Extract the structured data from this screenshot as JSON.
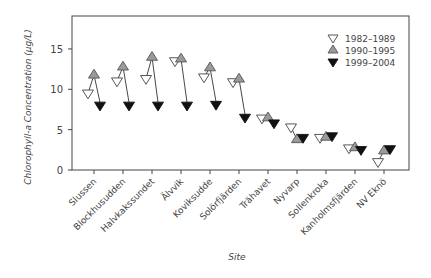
{
  "chart_data": {
    "type": "scatter",
    "title": "",
    "xlabel": "Site",
    "ylabel": "Chlorophyll-a Concentration (µg/L)",
    "ylim": [
      0,
      18
    ],
    "yticks": [
      0,
      5,
      10,
      15
    ],
    "grid": false,
    "legend_position": "upper right",
    "categories": [
      "Slussen",
      "Blockhusudden",
      "Halvkakssundet",
      "Älvvik",
      "Koviksudde",
      "Solörfjärden",
      "Trähavet",
      "Nyvarp",
      "Sollenkroka",
      "Kanholmsfjärden",
      "NV Eknö"
    ],
    "series": [
      {
        "name": "1982–1989",
        "marker": "open-down-triangle",
        "color": "#ffffff",
        "values": [
          9.5,
          11.0,
          11.3,
          13.5,
          11.5,
          10.9,
          6.4,
          5.3,
          4.0,
          2.7,
          1.0
        ]
      },
      {
        "name": "1990–1995",
        "marker": "gray-up-triangle",
        "color": "#9a9a9a",
        "values": [
          11.8,
          12.8,
          14.0,
          13.8,
          12.7,
          11.3,
          6.5,
          3.8,
          4.1,
          2.8,
          2.4
        ]
      },
      {
        "name": "1999–2004",
        "marker": "black-down-triangle",
        "color": "#111111",
        "values": [
          8.0,
          8.0,
          8.0,
          8.0,
          8.1,
          6.5,
          5.8,
          4.0,
          4.2,
          2.5,
          2.6
        ]
      }
    ],
    "annotations": "Arrows drawn from 1990–1995 value to 1999–2004 value for each site"
  }
}
